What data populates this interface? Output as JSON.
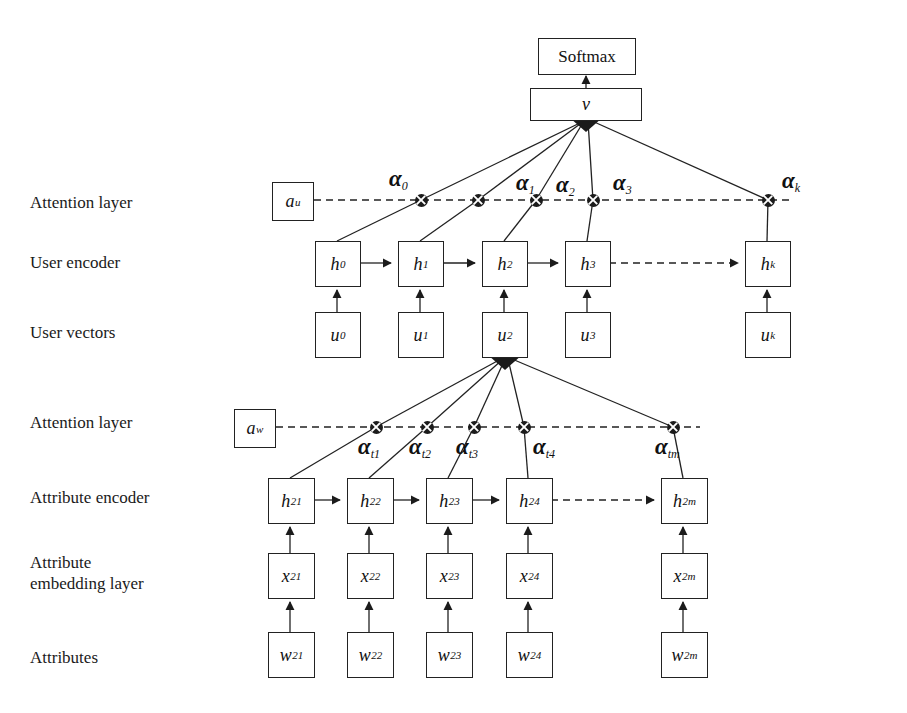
{
  "diagram": {
    "row_labels": [
      {
        "id": "attention-layer-user",
        "text": "Attention layer",
        "x": 30,
        "y": 192
      },
      {
        "id": "user-encoder",
        "text": "User encoder",
        "x": 30,
        "y": 252
      },
      {
        "id": "user-vectors",
        "text": "User vectors",
        "x": 30,
        "y": 322
      },
      {
        "id": "attention-layer-word",
        "text": "Attention layer",
        "x": 30,
        "y": 412
      },
      {
        "id": "attribute-encoder",
        "text": "Attribute encoder",
        "x": 30,
        "y": 487
      },
      {
        "id": "attribute-embedding",
        "text": "Attribute\nembedding layer",
        "x": 30,
        "y": 552
      },
      {
        "id": "attributes",
        "text": "Attributes",
        "x": 30,
        "y": 647
      }
    ],
    "output": {
      "softmax": {
        "label": "Softmax",
        "x": 538,
        "y": 38,
        "w": 96,
        "h": 35
      },
      "v": {
        "label": "v",
        "x": 530,
        "y": 88,
        "w": 110,
        "h": 31
      }
    },
    "attention_boxes": [
      {
        "id": "a-u",
        "base": "a",
        "sub": "u",
        "x": 272,
        "y": 182,
        "w": 40,
        "h": 37
      },
      {
        "id": "a-w",
        "base": "a",
        "sub": "w",
        "x": 234,
        "y": 409,
        "w": 40,
        "h": 37
      }
    ],
    "user_attention_nodes": [
      {
        "id": "alpha-0",
        "base": "α",
        "sub": "0",
        "cx": 421,
        "cy": 200,
        "lx": 389,
        "ly": 166
      },
      {
        "id": "alpha-1",
        "base": "α",
        "sub": "1",
        "cx": 478,
        "cy": 200,
        "lx": 516,
        "ly": 170
      },
      {
        "id": "alpha-2",
        "base": "α",
        "sub": "2",
        "cx": 536,
        "cy": 200,
        "lx": 556,
        "ly": 172
      },
      {
        "id": "alpha-3",
        "base": "α",
        "sub": "3",
        "cx": 593,
        "cy": 200,
        "lx": 613,
        "ly": 170
      },
      {
        "id": "alpha-k",
        "base": "α",
        "sub": "k",
        "cx": 768,
        "cy": 200,
        "lx": 782,
        "ly": 168
      }
    ],
    "user_encoder_boxes": [
      {
        "id": "h-0",
        "base": "h",
        "sub": "0",
        "x": 315,
        "y": 241,
        "w": 44,
        "h": 44
      },
      {
        "id": "h-1",
        "base": "h",
        "sub": "1",
        "x": 398,
        "y": 241,
        "w": 44,
        "h": 44
      },
      {
        "id": "h-2",
        "base": "h",
        "sub": "2",
        "x": 482,
        "y": 241,
        "w": 44,
        "h": 44
      },
      {
        "id": "h-3",
        "base": "h",
        "sub": "3",
        "x": 565,
        "y": 241,
        "w": 44,
        "h": 44
      },
      {
        "id": "h-k",
        "base": "h",
        "sub": "k",
        "x": 745,
        "y": 241,
        "w": 44,
        "h": 44
      }
    ],
    "user_vector_boxes": [
      {
        "id": "u-0",
        "base": "u",
        "sub": "0",
        "x": 315,
        "y": 312,
        "w": 44,
        "h": 44
      },
      {
        "id": "u-1",
        "base": "u",
        "sub": "1",
        "x": 398,
        "y": 312,
        "w": 44,
        "h": 44
      },
      {
        "id": "u-2",
        "base": "u",
        "sub": "2",
        "x": 482,
        "y": 312,
        "w": 44,
        "h": 44
      },
      {
        "id": "u-3",
        "base": "u",
        "sub": "3",
        "x": 565,
        "y": 312,
        "w": 44,
        "h": 44
      },
      {
        "id": "u-k",
        "base": "u",
        "sub": "k",
        "x": 745,
        "y": 312,
        "w": 44,
        "h": 44
      }
    ],
    "word_attention_nodes": [
      {
        "id": "alpha-t1",
        "base": "α",
        "sub": "t1",
        "cx": 376,
        "cy": 427,
        "lx": 358,
        "ly": 434
      },
      {
        "id": "alpha-t2",
        "base": "α",
        "sub": "t2",
        "cx": 427,
        "cy": 427,
        "lx": 409,
        "ly": 434
      },
      {
        "id": "alpha-t3",
        "base": "α",
        "sub": "t3",
        "cx": 474,
        "cy": 427,
        "lx": 456,
        "ly": 434
      },
      {
        "id": "alpha-t4",
        "base": "α",
        "sub": "t4",
        "cx": 524,
        "cy": 427,
        "lx": 510,
        "ly": 434
      },
      {
        "id": "alpha-tm",
        "base": "α",
        "sub": "tm",
        "cx": 673,
        "cy": 427,
        "lx": 655,
        "ly": 434
      }
    ],
    "attribute_encoder_boxes": [
      {
        "id": "h-21",
        "base": "h",
        "sub": "21",
        "x": 268,
        "y": 478,
        "w": 45,
        "h": 44
      },
      {
        "id": "h-22",
        "base": "h",
        "sub": "22",
        "x": 347,
        "y": 478,
        "w": 45,
        "h": 44
      },
      {
        "id": "h-23",
        "base": "h",
        "sub": "23",
        "x": 426,
        "y": 478,
        "w": 45,
        "h": 44
      },
      {
        "id": "h-24",
        "base": "h",
        "sub": "24",
        "x": 506,
        "y": 478,
        "w": 45,
        "h": 44
      },
      {
        "id": "h-2m",
        "base": "h",
        "sub": "2m",
        "x": 661,
        "y": 478,
        "w": 45,
        "h": 44
      }
    ],
    "attribute_embedding_boxes": [
      {
        "id": "x-21",
        "base": "x",
        "sub": "21",
        "x": 268,
        "y": 553,
        "w": 45,
        "h": 44
      },
      {
        "id": "x-22",
        "base": "x",
        "sub": "22",
        "x": 347,
        "y": 553,
        "w": 45,
        "h": 44
      },
      {
        "id": "x-23",
        "base": "x",
        "sub": "23",
        "x": 426,
        "y": 553,
        "w": 45,
        "h": 44
      },
      {
        "id": "x-24",
        "base": "x",
        "sub": "24",
        "x": 506,
        "y": 553,
        "w": 45,
        "h": 44
      },
      {
        "id": "x-2m",
        "base": "x",
        "sub": "2m",
        "x": 661,
        "y": 553,
        "w": 45,
        "h": 44
      }
    ],
    "attribute_boxes": [
      {
        "id": "w-21",
        "base": "w",
        "sub": "21",
        "x": 268,
        "y": 632,
        "w": 45,
        "h": 44
      },
      {
        "id": "w-22",
        "base": "w",
        "sub": "22",
        "x": 347,
        "y": 632,
        "w": 45,
        "h": 44
      },
      {
        "id": "w-23",
        "base": "w",
        "sub": "23",
        "x": 426,
        "y": 632,
        "w": 45,
        "h": 44
      },
      {
        "id": "w-24",
        "base": "w",
        "sub": "24",
        "x": 506,
        "y": 632,
        "w": 45,
        "h": 44
      },
      {
        "id": "w-2m",
        "base": "w",
        "sub": "2m",
        "x": 661,
        "y": 632,
        "w": 45,
        "h": 44
      }
    ],
    "colors": {
      "stroke": "#222222",
      "node_fill": "#1b1b1b",
      "background": "#ffffff",
      "text": "#111111"
    }
  }
}
